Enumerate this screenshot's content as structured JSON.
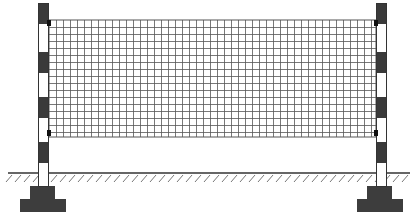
{
  "diagram": {
    "canvas": {
      "width": 414,
      "height": 224,
      "background": "#ffffff"
    },
    "colors": {
      "pole_dark": "#3a3a3a",
      "pole_light": "#ffffff",
      "pole_outline": "#333333",
      "net_line": "#555555",
      "ground_line": "#333333",
      "hatch": "#777777",
      "footing": "#3d3d3d",
      "clip": "#111111"
    },
    "net": {
      "x": 49,
      "y": 20,
      "width": 327,
      "height": 117,
      "cell": 7
    },
    "poles": [
      {
        "id": "left",
        "x": 38,
        "width": 11,
        "top": 3,
        "bottom": 186
      },
      {
        "id": "right",
        "x": 376,
        "width": 11,
        "top": 3,
        "bottom": 186
      }
    ],
    "stripes": [
      {
        "y": 3,
        "h": 21,
        "dark": true
      },
      {
        "y": 24,
        "h": 28,
        "dark": false
      },
      {
        "y": 52,
        "h": 21,
        "dark": true
      },
      {
        "y": 73,
        "h": 24,
        "dark": false
      },
      {
        "y": 97,
        "h": 21,
        "dark": true
      },
      {
        "y": 118,
        "h": 24,
        "dark": false
      },
      {
        "y": 142,
        "h": 21,
        "dark": true
      },
      {
        "y": 163,
        "h": 23,
        "dark": false
      }
    ],
    "clips": [
      {
        "x": 47,
        "y": 20,
        "w": 4,
        "h": 6
      },
      {
        "x": 47,
        "y": 130,
        "w": 4,
        "h": 6
      },
      {
        "x": 374,
        "y": 20,
        "w": 4,
        "h": 6
      },
      {
        "x": 374,
        "y": 130,
        "w": 4,
        "h": 6
      }
    ],
    "ground": {
      "y": 173,
      "x1": 8,
      "x2": 410
    },
    "footings": [
      {
        "id": "left",
        "upper": {
          "x": 30,
          "y": 186,
          "w": 25,
          "h": 14
        },
        "lower": {
          "x": 20,
          "y": 199,
          "w": 46,
          "h": 13
        }
      },
      {
        "id": "right",
        "upper": {
          "x": 367,
          "y": 186,
          "w": 25,
          "h": 14
        },
        "lower": {
          "x": 357,
          "y": 199,
          "w": 46,
          "h": 13
        }
      }
    ]
  }
}
